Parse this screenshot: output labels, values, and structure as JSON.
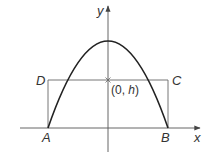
{
  "diagram": {
    "type": "parabola-with-inscribed-rectangle",
    "axes": {
      "x_label": "x",
      "y_label": "y"
    },
    "points": {
      "A": {
        "label": "A"
      },
      "B": {
        "label": "B"
      },
      "C": {
        "label": "C"
      },
      "D": {
        "label": "D"
      }
    },
    "marked_point": {
      "coord_text": "(0, ",
      "coord_var": "h",
      "coord_close": ")"
    },
    "colors": {
      "curve": "#222222",
      "axes": "#555555",
      "rectangle": "#666666",
      "text": "#333333"
    }
  }
}
